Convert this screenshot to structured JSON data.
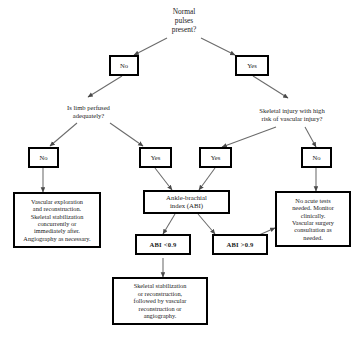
{
  "diagram": {
    "line_color": "#555555",
    "box_border_color": "#000000",
    "background": "#ffffff",
    "nodes": {
      "root": {
        "label": "Normal\npulses\npresent?",
        "type": "question-plain"
      },
      "root_no": {
        "label": "No",
        "type": "answer-box"
      },
      "root_yes": {
        "label": "Yes",
        "type": "answer-box"
      },
      "q_perfused": {
        "label": "Is limb perfused\nadequately?",
        "type": "question-plain"
      },
      "q_skeletal": {
        "label": "Skeletal injury with high\nrisk of vascular injury?",
        "type": "question-plain"
      },
      "perfused_no": {
        "label": "No",
        "type": "answer-box"
      },
      "perfused_yes": {
        "label": "Yes",
        "type": "answer-box"
      },
      "skeletal_yes": {
        "label": "Yes",
        "type": "answer-box"
      },
      "skeletal_no": {
        "label": "No",
        "type": "answer-box"
      },
      "vascular_exploration": {
        "label": "Vascular exploration\nand reconstruction.\nSkeletal stabilization\nconcurrently or\nimmediately after.\nAngiography as necessary.",
        "type": "outcome-box"
      },
      "abi": {
        "label": "Ankle-brachial\nindex (ABI)",
        "type": "test-box"
      },
      "abi_low": {
        "label": "ABI <0.9",
        "type": "result-box"
      },
      "abi_high": {
        "label": "ABI >0.9",
        "type": "result-box"
      },
      "skeletal_stabilization": {
        "label": "Skeletal stabilization\nor reconstruction,\nfollowed by vascular\nreconstruction or\nangiography.",
        "type": "outcome-box"
      },
      "no_acute_tests": {
        "label": "No acute tests\nneeded.  Monitor\nclinically.\nVascular surgery\nconsultation as\nneeded.",
        "type": "outcome-box"
      }
    }
  }
}
